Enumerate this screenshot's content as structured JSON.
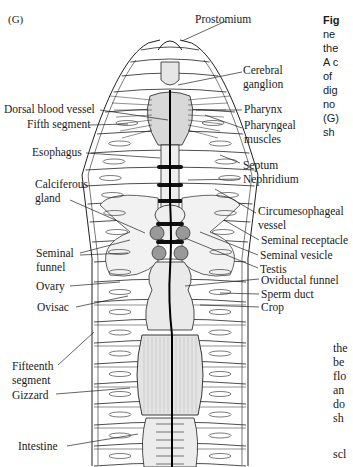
{
  "figure": {
    "panel_label": "(G)",
    "labels": {
      "prostomium": "Prostomium",
      "cerebral_ganglion_1": "Cerebral",
      "cerebral_ganglion_2": "ganglion",
      "dorsal_blood_vessel": "Dorsal blood vessel",
      "pharynx": "Pharynx",
      "fifth_segment": "Fifth segment",
      "pharyngeal_muscles_1": "Pharyngeal",
      "pharyngeal_muscles_2": "muscles",
      "esophagus": "Esophagus",
      "septum": "Septum",
      "nephridium": "Nephridium",
      "calciferous_gland_1": "Calciferous",
      "calciferous_gland_2": "gland",
      "circumesophageal_vessel_1": "Circumesophageal",
      "circumesophageal_vessel_2": "vessel",
      "seminal_receptacle": "Seminal receptacle",
      "seminal_funnel_1": "Seminal",
      "seminal_funnel_2": "funnel",
      "seminal_vesicle": "Seminal vesicle",
      "testis": "Testis",
      "ovary": "Ovary",
      "oviductal_funnel": "Oviductal funnel",
      "sperm_duct": "Sperm duct",
      "ovisac": "Ovisac",
      "crop": "Crop",
      "fifteenth_segment_1": "Fifteenth",
      "fifteenth_segment_2": "segment",
      "gizzard": "Gizzard",
      "intestine": "Intestine"
    }
  },
  "caption_fragment_top": [
    "Fig",
    "ne",
    "the",
    "A c",
    "of",
    "dig",
    "no",
    "(G)",
    "sh"
  ],
  "caption_fragment_bottom": [
    "the",
    "be",
    "flo",
    "an",
    "do",
    "sh",
    "",
    "scl"
  ]
}
